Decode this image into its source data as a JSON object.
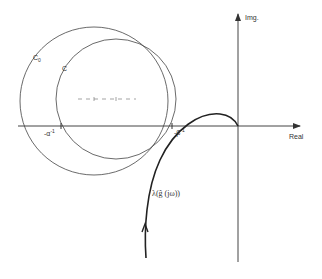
{
  "axes": {
    "real_label": "Real",
    "imag_label": "Img."
  },
  "circles": {
    "c0_label": "C",
    "c0_subscript": "0",
    "c_label": "C"
  },
  "points": {
    "alpha_label": "-α",
    "alpha_sup": "-1",
    "beta_label": "-β",
    "beta_sup": "-1"
  },
  "curve": {
    "label": "λ(ĝ (jω))"
  },
  "colors": {
    "line": "#333333",
    "background": "#ffffff"
  }
}
